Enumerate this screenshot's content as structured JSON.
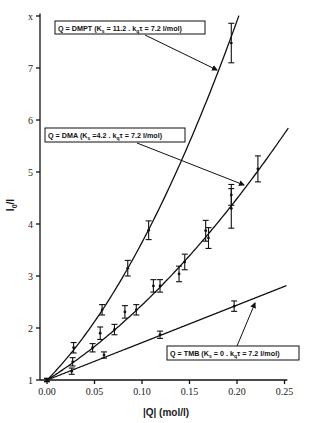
{
  "chart_data": {
    "type": "line",
    "title": "",
    "xlabel": "|Q| (mol/l)",
    "ylabel": "I0/I",
    "xlim": [
      0,
      0.25
    ],
    "ylim": [
      1,
      8
    ],
    "xticks": [
      "0.00",
      "0.05",
      "0.10",
      "0.15",
      "0.20",
      "0.25"
    ],
    "yticks": [
      "1",
      "2",
      "3",
      "4",
      "5",
      "6",
      "7",
      "8"
    ],
    "grid": false,
    "legend": "inline boxed annotations with arrows",
    "series": [
      {
        "name": "DMPT",
        "label": "Q = DMPT (K_s = 11.2 , k_qτ = 7.2 l/mol)",
        "Ks": 11.2,
        "kq_tau": 7.2,
        "fit": "curve (1+7.2[Q])(1+11.2[Q])",
        "points": [
          {
            "x": 0.0,
            "y": 1.0,
            "err": 0.03
          },
          {
            "x": 0.028,
            "y": 1.62,
            "err": 0.1
          },
          {
            "x": 0.058,
            "y": 2.35,
            "err": 0.1
          },
          {
            "x": 0.085,
            "y": 3.15,
            "err": 0.15
          },
          {
            "x": 0.107,
            "y": 3.88,
            "err": 0.18
          },
          {
            "x": 0.194,
            "y": 7.48,
            "err": 0.38
          }
        ]
      },
      {
        "name": "DMA",
        "label": "Q = DMA (K_s =4.2 , k_qτ = 7.2 l/mol)",
        "Ks": 4.2,
        "kq_tau": 7.2,
        "fit": "curve (1+7.2[Q])(1+4.2[Q])",
        "points": [
          {
            "x": 0.0,
            "y": 1.0,
            "err": 0.03
          },
          {
            "x": 0.027,
            "y": 1.35,
            "err": 0.08
          },
          {
            "x": 0.048,
            "y": 1.62,
            "err": 0.08
          },
          {
            "x": 0.056,
            "y": 1.9,
            "err": 0.12
          },
          {
            "x": 0.071,
            "y": 1.97,
            "err": 0.1
          },
          {
            "x": 0.082,
            "y": 2.31,
            "err": 0.12
          },
          {
            "x": 0.094,
            "y": 2.35,
            "err": 0.1
          },
          {
            "x": 0.112,
            "y": 2.81,
            "err": 0.12
          },
          {
            "x": 0.119,
            "y": 2.81,
            "err": 0.12
          },
          {
            "x": 0.139,
            "y": 3.04,
            "err": 0.15
          },
          {
            "x": 0.145,
            "y": 3.27,
            "err": 0.15
          },
          {
            "x": 0.167,
            "y": 3.87,
            "err": 0.2
          },
          {
            "x": 0.17,
            "y": 3.73,
            "err": 0.2
          },
          {
            "x": 0.194,
            "y": 4.3,
            "err": 0.38
          },
          {
            "x": 0.194,
            "y": 4.56,
            "err": 0.2
          },
          {
            "x": 0.222,
            "y": 5.06,
            "err": 0.25
          }
        ]
      },
      {
        "name": "TMB",
        "label": "Q = TMB (K_s = 0 , k_qτ = 7.2 l/mol)",
        "Ks": 0,
        "kq_tau": 7.2,
        "fit": "line 1+7.2[Q]",
        "points": [
          {
            "x": 0.0,
            "y": 1.0,
            "err": 0.03
          },
          {
            "x": 0.026,
            "y": 1.17,
            "err": 0.06
          },
          {
            "x": 0.06,
            "y": 1.48,
            "err": 0.06
          },
          {
            "x": 0.119,
            "y": 1.87,
            "err": 0.07
          },
          {
            "x": 0.197,
            "y": 2.42,
            "err": 0.1
          }
        ]
      }
    ]
  },
  "labels": {
    "dmpt": "Q = DMPT  (K",
    "dmpt_rest": " = 11.2 . k",
    "dmpt_tail": "τ = 7.2 l/mol)",
    "dma": "Q = DMA  (K",
    "dma_rest": " =4.2 . k",
    "dma_tail": "τ = 7.2 l/mol)",
    "tmb": "Q = TMB  (K",
    "tmb_rest": " = 0 . k",
    "tmb_tail": "τ = 7.2 l/mol)",
    "sub_s": "s",
    "sub_q": "q"
  },
  "axes": {
    "xlabel": "|Q| (mol/l)",
    "ylabel_main": "I",
    "ylabel_sub": "0",
    "ylabel_tail": "/I"
  }
}
